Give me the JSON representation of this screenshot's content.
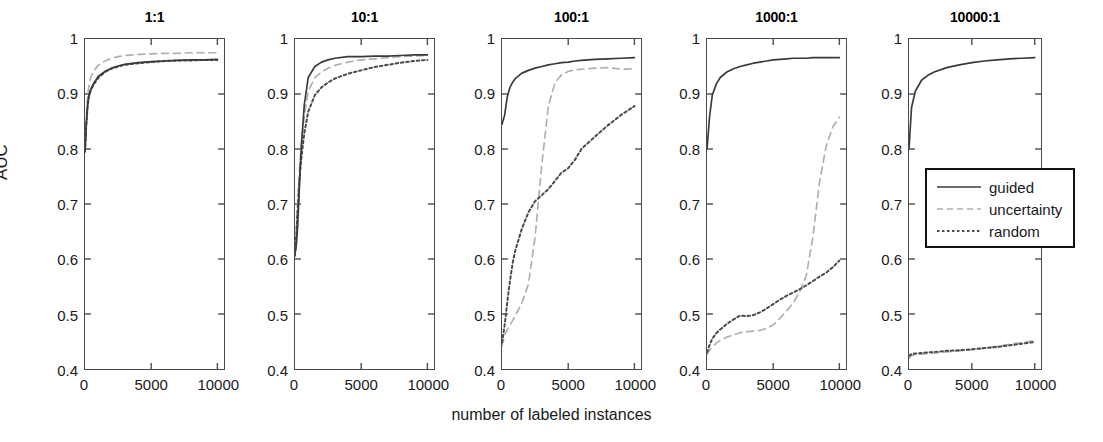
{
  "figure": {
    "x_axis_title": "number of labeled instances",
    "y_axis_title": "AUC"
  },
  "legend": {
    "position": "inside-panel-5-middle-right",
    "entries": [
      {
        "label": "guided",
        "style": "solid",
        "color": "#3a3a3a",
        "swatch": "legend-swatch-guided"
      },
      {
        "label": "uncertainty",
        "style": "dashed",
        "color": "#b0b0b0",
        "swatch": "legend-swatch-uncertainty"
      },
      {
        "label": "random",
        "style": "dotted",
        "color": "#4a4a4a",
        "swatch": "legend-swatch-random"
      }
    ]
  },
  "axes": {
    "y_ticks": [
      "0.4",
      "0.5",
      "0.6",
      "0.7",
      "0.8",
      "0.9",
      "1"
    ],
    "y_tick_values": [
      0.4,
      0.5,
      0.6,
      0.7,
      0.8,
      0.9,
      1.0
    ],
    "x_ticks": [
      "0",
      "5000",
      "10000"
    ],
    "x_tick_values": [
      0,
      5000,
      10000
    ],
    "ylim": [
      0.4,
      1.0
    ],
    "xlim": [
      0,
      10500
    ],
    "grid": false
  },
  "chart_data": {
    "type": "line",
    "title": "",
    "subtitle": "",
    "xlabel": "number of labeled instances",
    "ylabel": "AUC",
    "xlim": [
      0,
      10500
    ],
    "ylim": [
      0.4,
      1.0
    ],
    "grid": false,
    "legend_position": "inside panel 10000:1, middle right",
    "panel_titles": [
      "1:1",
      "10:1",
      "100:1",
      "1000:1",
      "10000:1"
    ],
    "panels": [
      {
        "title": "1:1",
        "x": [
          0,
          100,
          200,
          300,
          400,
          500,
          700,
          1000,
          1500,
          2000,
          2500,
          3000,
          4000,
          5000,
          6000,
          7000,
          8000,
          9000,
          10000
        ],
        "series": [
          {
            "name": "guided",
            "style": "solid",
            "values": [
              0.795,
              0.845,
              0.88,
              0.898,
              0.906,
              0.912,
              0.921,
              0.932,
              0.941,
              0.947,
              0.951,
              0.954,
              0.957,
              0.959,
              0.96,
              0.961,
              0.962,
              0.962,
              0.963
            ]
          },
          {
            "name": "uncertainty",
            "style": "dashed",
            "values": [
              0.795,
              0.855,
              0.896,
              0.916,
              0.927,
              0.934,
              0.943,
              0.952,
              0.96,
              0.965,
              0.968,
              0.97,
              0.972,
              0.973,
              0.974,
              0.974,
              0.975,
              0.975,
              0.975
            ]
          },
          {
            "name": "random",
            "style": "dotted",
            "values": [
              0.795,
              0.845,
              0.879,
              0.896,
              0.904,
              0.91,
              0.919,
              0.929,
              0.94,
              0.946,
              0.95,
              0.953,
              0.956,
              0.958,
              0.96,
              0.961,
              0.961,
              0.962,
              0.962
            ]
          }
        ]
      },
      {
        "title": "10:1",
        "x": [
          0,
          100,
          200,
          300,
          400,
          500,
          700,
          1000,
          1500,
          2000,
          2500,
          3000,
          4000,
          5000,
          6000,
          7000,
          8000,
          9000,
          10000
        ],
        "series": [
          {
            "name": "guided",
            "style": "solid",
            "values": [
              0.61,
              0.625,
              0.66,
              0.712,
              0.77,
              0.812,
              0.88,
              0.93,
              0.95,
              0.958,
              0.962,
              0.965,
              0.968,
              0.968,
              0.969,
              0.969,
              0.97,
              0.971,
              0.971
            ]
          },
          {
            "name": "uncertainty",
            "style": "dashed",
            "values": [
              0.608,
              0.65,
              0.7,
              0.745,
              0.782,
              0.812,
              0.86,
              0.905,
              0.93,
              0.94,
              0.947,
              0.952,
              0.958,
              0.962,
              0.964,
              0.966,
              0.968,
              0.969,
              0.97
            ]
          },
          {
            "name": "random",
            "style": "dotted",
            "values": [
              0.606,
              0.645,
              0.69,
              0.73,
              0.762,
              0.788,
              0.828,
              0.868,
              0.898,
              0.912,
              0.921,
              0.928,
              0.937,
              0.943,
              0.949,
              0.953,
              0.957,
              0.96,
              0.962
            ]
          }
        ]
      },
      {
        "title": "100:1",
        "x": [
          0,
          200,
          400,
          600,
          800,
          1000,
          1500,
          2000,
          2500,
          3000,
          3500,
          4000,
          4500,
          5000,
          5500,
          6000,
          7000,
          8000,
          9000,
          10000
        ],
        "series": [
          {
            "name": "guided",
            "style": "solid",
            "values": [
              0.845,
              0.862,
              0.895,
              0.912,
              0.921,
              0.928,
              0.938,
              0.943,
              0.947,
              0.95,
              0.953,
              0.955,
              0.957,
              0.958,
              0.96,
              0.961,
              0.963,
              0.964,
              0.965,
              0.966
            ]
          },
          {
            "name": "uncertainty",
            "style": "dashed",
            "values": [
              0.442,
              0.462,
              0.472,
              0.48,
              0.488,
              0.497,
              0.52,
              0.555,
              0.64,
              0.77,
              0.878,
              0.92,
              0.935,
              0.941,
              0.944,
              0.945,
              0.947,
              0.948,
              0.945,
              0.946
            ]
          },
          {
            "name": "random",
            "style": "dotted",
            "values": [
              0.448,
              0.48,
              0.522,
              0.56,
              0.592,
              0.615,
              0.655,
              0.685,
              0.705,
              0.716,
              0.727,
              0.742,
              0.757,
              0.765,
              0.78,
              0.8,
              0.822,
              0.843,
              0.862,
              0.878
            ]
          }
        ]
      },
      {
        "title": "1000:1",
        "x": [
          0,
          200,
          400,
          700,
          1000,
          1500,
          2000,
          2500,
          3000,
          3500,
          4000,
          4500,
          5000,
          5500,
          6000,
          6500,
          7000,
          7500,
          8000,
          8500,
          9000,
          9500,
          10000
        ],
        "series": [
          {
            "name": "guided",
            "style": "solid",
            "values": [
              0.8,
              0.86,
              0.898,
              0.918,
              0.93,
              0.94,
              0.946,
              0.95,
              0.953,
              0.956,
              0.958,
              0.96,
              0.962,
              0.963,
              0.964,
              0.965,
              0.965,
              0.965,
              0.966,
              0.966,
              0.966,
              0.966,
              0.966
            ]
          },
          {
            "name": "uncertainty",
            "style": "dashed",
            "values": [
              0.427,
              0.434,
              0.44,
              0.447,
              0.452,
              0.458,
              0.462,
              0.466,
              0.468,
              0.469,
              0.47,
              0.474,
              0.48,
              0.492,
              0.505,
              0.52,
              0.54,
              0.57,
              0.64,
              0.74,
              0.805,
              0.84,
              0.858
            ]
          },
          {
            "name": "random",
            "style": "dotted",
            "values": [
              0.43,
              0.444,
              0.455,
              0.465,
              0.472,
              0.482,
              0.49,
              0.497,
              0.496,
              0.498,
              0.503,
              0.51,
              0.518,
              0.526,
              0.533,
              0.539,
              0.545,
              0.552,
              0.56,
              0.568,
              0.575,
              0.585,
              0.597
            ]
          }
        ]
      },
      {
        "title": "10000:1",
        "x": [
          0,
          200,
          500,
          1000,
          1500,
          2000,
          3000,
          4000,
          5000,
          6000,
          7000,
          8000,
          9000,
          10000
        ],
        "series": [
          {
            "name": "guided",
            "style": "solid",
            "values": [
              0.8,
              0.875,
              0.905,
              0.925,
              0.934,
              0.94,
              0.948,
              0.953,
              0.957,
              0.96,
              0.962,
              0.964,
              0.965,
              0.966
            ]
          },
          {
            "name": "uncertainty",
            "style": "dashed",
            "values": [
              0.42,
              0.424,
              0.426,
              0.427,
              0.428,
              0.429,
              0.431,
              0.433,
              0.435,
              0.438,
              0.441,
              0.445,
              0.448,
              0.452
            ]
          },
          {
            "name": "random",
            "style": "dotted",
            "values": [
              0.424,
              0.427,
              0.428,
              0.429,
              0.43,
              0.431,
              0.433,
              0.434,
              0.436,
              0.438,
              0.44,
              0.443,
              0.446,
              0.449
            ]
          }
        ]
      }
    ]
  },
  "panel_layout": [
    {
      "key": "p1",
      "left": 84,
      "title_key": "1:1"
    },
    {
      "key": "p2",
      "left": 294,
      "title_key": "10:1"
    },
    {
      "key": "p3",
      "left": 501,
      "title_key": "100:1"
    },
    {
      "key": "p4",
      "left": 706,
      "title_key": "1000:1"
    },
    {
      "key": "p5",
      "left": 908,
      "title_key": "10000:1"
    }
  ]
}
